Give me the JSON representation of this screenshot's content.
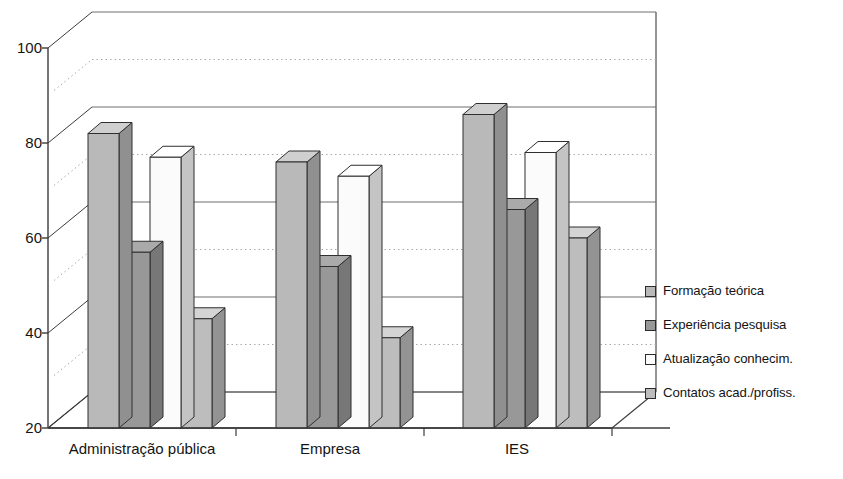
{
  "chart_data": {
    "type": "bar",
    "title": "",
    "xlabel": "",
    "ylabel": "",
    "ylim": [
      20,
      100
    ],
    "yticks": [
      20,
      40,
      60,
      80,
      100
    ],
    "minor_gridlines": [
      30,
      50,
      70,
      90
    ],
    "grid": true,
    "three_d": true,
    "legend_position": "right",
    "categories": [
      "Administração pública",
      "Empresa",
      "IES"
    ],
    "series": [
      {
        "name": "Formação teórica",
        "values": [
          82,
          76,
          86
        ],
        "color": "#b9b9b9"
      },
      {
        "name": "Experiência pesquisa",
        "values": [
          57,
          54,
          66
        ],
        "color": "#989898"
      },
      {
        "name": "Atualização conhecim.",
        "values": [
          77,
          73,
          78
        ],
        "color": "#fbfbfb"
      },
      {
        "name": "Contatos acad./profiss.",
        "values": [
          43,
          39,
          60
        ],
        "color": "#bdbdbd"
      }
    ]
  },
  "legend": {
    "items": [
      {
        "label": "Formação teórica"
      },
      {
        "label": "Experiência pesquisa"
      },
      {
        "label": "Atualização conhecim."
      },
      {
        "label": "Contatos acad./profiss."
      }
    ]
  },
  "axis": {
    "y_labels": [
      "100",
      "80",
      "60",
      "40",
      "20"
    ],
    "x_labels": [
      "Administração pública",
      "Empresa",
      "IES"
    ]
  },
  "colors": {
    "line": "#3c3c3c",
    "grid_solid": "#6e6e6e",
    "grid_dotted": "#a9a9a9",
    "text": "#141414",
    "bar_top": "#d3d3d3",
    "bar_side": "#8d8d8d"
  }
}
